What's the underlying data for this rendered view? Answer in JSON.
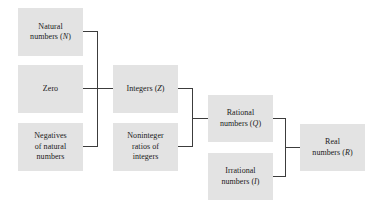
{
  "diagram": {
    "type": "hierarchy-tree",
    "background_color": "#ffffff",
    "box_fill_color": "#e3e3e3",
    "line_color": "#3c3c3c",
    "text_color": "#1a1a1a",
    "nodes": [
      {
        "id": "natural-numbers",
        "lines": [
          "Natural",
          "numbers (N)"
        ],
        "text": "Natural\nnumbers (N)",
        "symbol": "N",
        "level": 1,
        "x": 18,
        "y": 8,
        "w": 65,
        "h": 48
      },
      {
        "id": "zero",
        "lines": [
          "Zero"
        ],
        "text": "Zero",
        "symbol": "",
        "level": 1,
        "x": 18,
        "y": 65,
        "w": 65,
        "h": 48
      },
      {
        "id": "negatives-of-natural-numbers",
        "lines": [
          "Negatives",
          "of natural",
          "numbers"
        ],
        "text": "Negatives\nof natural\nnumbers",
        "symbol": "",
        "level": 1,
        "x": 18,
        "y": 123,
        "w": 65,
        "h": 48
      },
      {
        "id": "integers",
        "lines": [
          "Integers (Z)"
        ],
        "text": "Integers (Z)",
        "symbol": "Z",
        "level": 2,
        "x": 113,
        "y": 65,
        "w": 65,
        "h": 48
      },
      {
        "id": "noninteger-ratios-of-integers",
        "lines": [
          "Noninteger",
          "ratios of",
          "integers"
        ],
        "text": "Noninteger\nratios of\nintegers",
        "symbol": "",
        "level": 2,
        "x": 113,
        "y": 123,
        "w": 65,
        "h": 48
      },
      {
        "id": "rational-numbers",
        "lines": [
          "Rational",
          "numbers (Q)"
        ],
        "text": "Rational\nnumbers (Q)",
        "symbol": "Q",
        "level": 3,
        "x": 208,
        "y": 95,
        "w": 65,
        "h": 47
      },
      {
        "id": "irrational-numbers",
        "lines": [
          "Irrational",
          "numbers (I)"
        ],
        "text": "Irrational\nnumbers (I)",
        "symbol": "I",
        "level": 3,
        "x": 208,
        "y": 153,
        "w": 65,
        "h": 47
      },
      {
        "id": "real-numbers",
        "lines": [
          "Real",
          "numbers (R)"
        ],
        "text": "Real\nnumbers (R)",
        "symbol": "R",
        "level": 4,
        "x": 300,
        "y": 124,
        "w": 65,
        "h": 47
      }
    ],
    "connectors": [
      {
        "id": "natural-to-bus1",
        "orientation": "h",
        "x": 83,
        "y": 31,
        "length": 15
      },
      {
        "id": "zero-to-bus1",
        "orientation": "h",
        "x": 83,
        "y": 88,
        "length": 15
      },
      {
        "id": "negatives-to-bus1",
        "orientation": "h",
        "x": 83,
        "y": 146,
        "length": 15
      },
      {
        "id": "bus1-vertical",
        "orientation": "v",
        "x": 97,
        "y": 31,
        "length": 116
      },
      {
        "id": "bus1-to-integers",
        "orientation": "h",
        "x": 97,
        "y": 88,
        "length": 17
      },
      {
        "id": "integers-to-bus2",
        "orientation": "h",
        "x": 178,
        "y": 88,
        "length": 15
      },
      {
        "id": "noninteger-to-bus2",
        "orientation": "h",
        "x": 178,
        "y": 146,
        "length": 15
      },
      {
        "id": "bus2-vertical",
        "orientation": "v",
        "x": 192,
        "y": 88,
        "length": 59
      },
      {
        "id": "bus2-to-rational",
        "orientation": "h",
        "x": 192,
        "y": 118,
        "length": 17
      },
      {
        "id": "rational-to-bus3",
        "orientation": "h",
        "x": 273,
        "y": 118,
        "length": 13
      },
      {
        "id": "irrational-to-bus3",
        "orientation": "h",
        "x": 273,
        "y": 176,
        "length": 13
      },
      {
        "id": "bus3-vertical",
        "orientation": "v",
        "x": 285,
        "y": 118,
        "length": 59
      },
      {
        "id": "bus3-to-real",
        "orientation": "h",
        "x": 285,
        "y": 147,
        "length": 16
      }
    ]
  }
}
